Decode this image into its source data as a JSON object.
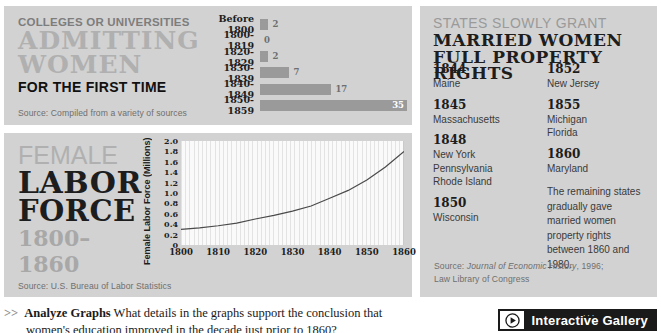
{
  "colleges": {
    "kicker": "COLLEGES OR UNIVERSITIES",
    "title_line1": "ADMITTING",
    "title_line2": "WOMEN",
    "subtitle": "FOR THE FIRST TIME",
    "source": "Source: Compiled from a variety of sources"
  },
  "labor": {
    "title_line1": "FEMALE",
    "title_line2": "LABOR",
    "title_line3": "FORCE",
    "title_years": "1800–1860",
    "source": "Source: U.S. Bureau of Labor Statistics"
  },
  "states": {
    "kicker": "STATES SLOWLY GRANT",
    "title_line1": "MARRIED WOMEN",
    "title_line2": "FULL PROPERTY RIGHTS",
    "column_left": [
      {
        "year": "1844",
        "states": [
          "Maine"
        ]
      },
      {
        "year": "1845",
        "states": [
          "Massachusetts"
        ]
      },
      {
        "year": "1848",
        "states": [
          "New York",
          "Pennsylvania",
          "Rhode Island"
        ]
      },
      {
        "year": "1850",
        "states": [
          "Wisconsin"
        ]
      }
    ],
    "column_right": [
      {
        "year": "1852",
        "states": [
          "New Jersey"
        ]
      },
      {
        "year": "1855",
        "states": [
          "Michigan",
          "Florida"
        ]
      },
      {
        "year": "1860",
        "states": [
          "Maryland"
        ]
      }
    ],
    "note": "The remaining states gradually gave married women property rights between 1860 and 1980.",
    "source_prefix": "Source: ",
    "source_italic": "Journal of Economic History",
    "source_suffix": ", 1996;",
    "source_line2": "Law Library of Congress"
  },
  "footer": {
    "chevron": ">>",
    "prompt_bold": "Analyze Graphs",
    "prompt_line1": " What details in the graphs support the conclusion that",
    "prompt_line2": "women's education improved in the decade just prior to 1860?",
    "gallery_label": "Interactive Gallery",
    "gallery_icon": "play-circle-icon",
    "gallery_dots": "···"
  },
  "colors": {
    "panel_bg": "#d2d2d2",
    "bar_fill": "#9a9a9a",
    "line_stroke": "#4a4a4a",
    "plot_bg": "#fafafa",
    "accent_dark": "#1a1a1a"
  },
  "chart_data": [
    {
      "type": "bar",
      "title": "Colleges or universities admitting women for the first time",
      "orientation": "horizontal",
      "categories": [
        "Before 1800",
        "1800-1819",
        "1820-1829",
        "1830-1839",
        "1840-1849",
        "1850-1859"
      ],
      "values": [
        2,
        0,
        2,
        7,
        17,
        35
      ],
      "value_labels": [
        "2",
        "0",
        "2",
        "7",
        "17",
        "35"
      ],
      "xlabel": "",
      "ylabel": "",
      "xlim": [
        0,
        35
      ],
      "grid": false,
      "legend": "none",
      "source": "Compiled from a variety of sources"
    },
    {
      "type": "line",
      "title": "Female Labor Force 1800–1860",
      "xlabel": "",
      "ylabel": "Female Labor Force (Millions)",
      "x": [
        1800,
        1805,
        1810,
        1815,
        1820,
        1825,
        1830,
        1835,
        1840,
        1845,
        1850,
        1855,
        1860
      ],
      "values": [
        0.3,
        0.33,
        0.37,
        0.42,
        0.5,
        0.57,
        0.65,
        0.75,
        0.9,
        1.05,
        1.25,
        1.5,
        1.8
      ],
      "xticks": [
        1800,
        1810,
        1820,
        1830,
        1840,
        1850,
        1860
      ],
      "yticks": [
        0,
        0.2,
        0.4,
        0.6,
        0.8,
        1.0,
        1.2,
        1.4,
        1.6,
        1.8,
        2.0
      ],
      "ytick_labels": [
        "0",
        "0.2",
        "0.4",
        "0.6",
        "0.8",
        "1.0",
        "1.2",
        "1.4",
        "1.6",
        "1.8",
        "2.0"
      ],
      "xlim": [
        1800,
        1860
      ],
      "ylim": [
        0,
        2.0
      ],
      "grid": true,
      "legend": "none",
      "source": "U.S. Bureau of Labor Statistics"
    }
  ]
}
